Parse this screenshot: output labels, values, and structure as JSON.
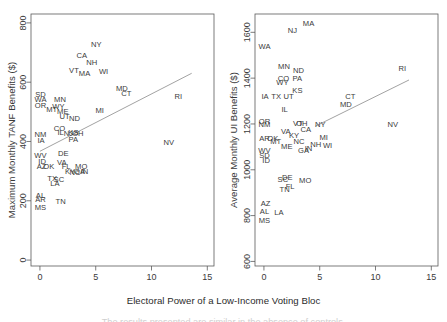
{
  "figure": {
    "xlabel": "Electoral Power of a Low-Income Voting Bloc",
    "caption_faint": "The results presented are similar in the absence of controls."
  },
  "chart_data": [
    {
      "type": "scatter",
      "panel": "left",
      "title": "",
      "xlabel": "Electoral Power of a Low-Income Voting Bloc",
      "ylabel": "Maximum Monthly TANF Benefits ($)",
      "xlim": [
        -0.8,
        15.6
      ],
      "ylim": [
        -20,
        830
      ],
      "xticks": [
        0,
        5,
        10,
        15
      ],
      "yticks": [
        0,
        200,
        400,
        600,
        800
      ],
      "xtick_labels": [
        "0",
        "5",
        "10",
        "15"
      ],
      "ytick_labels": [
        "0",
        "200",
        "400",
        "600",
        "800"
      ],
      "grid": false,
      "legend": "none",
      "point_style": "text-labels",
      "fit_line": {
        "x": [
          0.0,
          13.6
        ],
        "y": [
          367,
          630
        ],
        "color": "#8a8a8a"
      },
      "points": [
        {
          "label": "NY",
          "x": 5.05,
          "y": 727
        },
        {
          "label": "CA",
          "x": 3.75,
          "y": 690
        },
        {
          "label": "NH",
          "x": 4.65,
          "y": 665
        },
        {
          "label": "VT",
          "x": 3.05,
          "y": 641
        },
        {
          "label": "MA",
          "x": 4.0,
          "y": 629
        },
        {
          "label": "WI",
          "x": 5.7,
          "y": 637
        },
        {
          "label": "MD",
          "x": 7.35,
          "y": 578
        },
        {
          "label": "CT",
          "x": 7.75,
          "y": 562
        },
        {
          "label": "RI",
          "x": 12.4,
          "y": 553
        },
        {
          "label": "SD",
          "x": 0.05,
          "y": 559
        },
        {
          "label": "WA",
          "x": 0.05,
          "y": 541
        },
        {
          "label": "OR",
          "x": 0.05,
          "y": 521
        },
        {
          "label": "MN",
          "x": 1.8,
          "y": 540
        },
        {
          "label": "WY",
          "x": 1.65,
          "y": 519
        },
        {
          "label": "MT",
          "x": 1.05,
          "y": 508
        },
        {
          "label": "ME",
          "x": 2.05,
          "y": 500
        },
        {
          "label": "UT",
          "x": 2.2,
          "y": 483
        },
        {
          "label": "ND",
          "x": 3.1,
          "y": 477
        },
        {
          "label": "MI",
          "x": 5.35,
          "y": 505
        },
        {
          "label": "CO",
          "x": 1.75,
          "y": 443
        },
        {
          "label": "IL",
          "x": 1.85,
          "y": 429
        },
        {
          "label": "NM",
          "x": 0.05,
          "y": 424
        },
        {
          "label": "IA",
          "x": 0.1,
          "y": 405
        },
        {
          "label": "NJ",
          "x": 2.55,
          "y": 427
        },
        {
          "label": "KS",
          "x": 3.0,
          "y": 429
        },
        {
          "label": "OH",
          "x": 3.4,
          "y": 428
        },
        {
          "label": "PA",
          "x": 3.0,
          "y": 406
        },
        {
          "label": "NV",
          "x": 11.55,
          "y": 395
        },
        {
          "label": "WV",
          "x": 0.05,
          "y": 353
        },
        {
          "label": "DE",
          "x": 2.1,
          "y": 358
        },
        {
          "label": "ID",
          "x": 0.2,
          "y": 331
        },
        {
          "label": "AZ",
          "x": 0.15,
          "y": 316
        },
        {
          "label": "OK",
          "x": 0.8,
          "y": 315
        },
        {
          "label": "VA",
          "x": 1.95,
          "y": 329
        },
        {
          "label": "FL",
          "x": 2.35,
          "y": 315
        },
        {
          "label": "MO",
          "x": 3.7,
          "y": 314
        },
        {
          "label": "KY",
          "x": 2.7,
          "y": 300
        },
        {
          "label": "NC",
          "x": 3.15,
          "y": 297
        },
        {
          "label": "GA",
          "x": 3.55,
          "y": 300
        },
        {
          "label": "IN",
          "x": 4.0,
          "y": 299
        },
        {
          "label": "TX",
          "x": 1.1,
          "y": 274
        },
        {
          "label": "SC",
          "x": 1.7,
          "y": 273
        },
        {
          "label": "LA",
          "x": 1.35,
          "y": 257
        },
        {
          "label": "AL",
          "x": 0.05,
          "y": 219
        },
        {
          "label": "AR",
          "x": 0.05,
          "y": 203
        },
        {
          "label": "TN",
          "x": 1.85,
          "y": 198
        },
        {
          "label": "MS",
          "x": 0.05,
          "y": 178
        }
      ]
    },
    {
      "type": "scatter",
      "panel": "right",
      "title": "",
      "xlabel": "Electoral Power of a Low-Income Voting Bloc",
      "ylabel": "Average Monthly UI Benefits ($)",
      "xlim": [
        -0.8,
        15.6
      ],
      "ylim": [
        580,
        1680
      ],
      "xticks": [
        0,
        5,
        10,
        15
      ],
      "yticks": [
        600,
        800,
        1000,
        1200,
        1400,
        1600
      ],
      "xtick_labels": [
        "0",
        "5",
        "10",
        "15"
      ],
      "ytick_labels": [
        "600",
        "800",
        "1000",
        "1200",
        "1400",
        "1600"
      ],
      "grid": false,
      "legend": "none",
      "point_style": "text-labels",
      "fit_line": {
        "x": [
          4.6,
          13.0
        ],
        "y": [
          1190,
          1392
        ],
        "color": "#8a8a8a"
      },
      "points": [
        {
          "label": "MA",
          "x": 4.0,
          "y": 1638
        },
        {
          "label": "NJ",
          "x": 2.55,
          "y": 1608
        },
        {
          "label": "WA",
          "x": 0.05,
          "y": 1538
        },
        {
          "label": "MN",
          "x": 1.8,
          "y": 1452
        },
        {
          "label": "ND",
          "x": 3.1,
          "y": 1432
        },
        {
          "label": "RI",
          "x": 12.4,
          "y": 1443
        },
        {
          "label": "CO",
          "x": 1.75,
          "y": 1400
        },
        {
          "label": "PA",
          "x": 3.0,
          "y": 1398
        },
        {
          "label": "WY",
          "x": 1.65,
          "y": 1382
        },
        {
          "label": "KS",
          "x": 3.0,
          "y": 1348
        },
        {
          "label": "IA",
          "x": 0.1,
          "y": 1320
        },
        {
          "label": "TX",
          "x": 1.1,
          "y": 1320
        },
        {
          "label": "UT",
          "x": 2.2,
          "y": 1318
        },
        {
          "label": "CT",
          "x": 7.75,
          "y": 1318
        },
        {
          "label": "MD",
          "x": 7.35,
          "y": 1283
        },
        {
          "label": "IL",
          "x": 1.85,
          "y": 1262
        },
        {
          "label": "OR",
          "x": 0.05,
          "y": 1212
        },
        {
          "label": "NM",
          "x": 0.05,
          "y": 1198
        },
        {
          "label": "VT",
          "x": 3.05,
          "y": 1203
        },
        {
          "label": "OH",
          "x": 3.4,
          "y": 1204
        },
        {
          "label": "NY",
          "x": 5.05,
          "y": 1198
        },
        {
          "label": "NV",
          "x": 11.55,
          "y": 1198
        },
        {
          "label": "CA",
          "x": 3.75,
          "y": 1178
        },
        {
          "label": "VA",
          "x": 1.95,
          "y": 1165
        },
        {
          "label": "KY",
          "x": 2.7,
          "y": 1148
        },
        {
          "label": "AR",
          "x": 0.05,
          "y": 1138
        },
        {
          "label": "OK",
          "x": 0.8,
          "y": 1138
        },
        {
          "label": "MI",
          "x": 5.35,
          "y": 1142
        },
        {
          "label": "MT",
          "x": 1.05,
          "y": 1122
        },
        {
          "label": "NC",
          "x": 3.15,
          "y": 1122
        },
        {
          "label": "NH",
          "x": 4.65,
          "y": 1112
        },
        {
          "label": "WI",
          "x": 5.7,
          "y": 1105
        },
        {
          "label": "ME",
          "x": 2.05,
          "y": 1102
        },
        {
          "label": "WV",
          "x": 0.05,
          "y": 1082
        },
        {
          "label": "GA",
          "x": 3.55,
          "y": 1082
        },
        {
          "label": "IN",
          "x": 4.0,
          "y": 1092
        },
        {
          "label": "SD",
          "x": 0.05,
          "y": 1062
        },
        {
          "label": "ID",
          "x": 0.2,
          "y": 1040
        },
        {
          "label": "SC",
          "x": 1.7,
          "y": 958
        },
        {
          "label": "DE",
          "x": 2.1,
          "y": 965
        },
        {
          "label": "MO",
          "x": 3.7,
          "y": 955
        },
        {
          "label": "FL",
          "x": 2.35,
          "y": 925
        },
        {
          "label": "TN",
          "x": 1.85,
          "y": 912
        },
        {
          "label": "AZ",
          "x": 0.15,
          "y": 855
        },
        {
          "label": "AL",
          "x": 0.05,
          "y": 818
        },
        {
          "label": "LA",
          "x": 1.35,
          "y": 812
        },
        {
          "label": "MS",
          "x": 0.05,
          "y": 778
        }
      ]
    }
  ]
}
